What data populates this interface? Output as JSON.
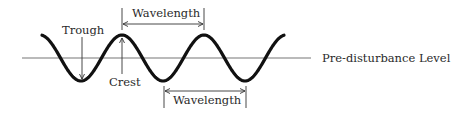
{
  "diagram": {
    "labels": {
      "trough": "Trough",
      "crest": "Crest",
      "wavelength_top": "Wavelength",
      "wavelength_bottom": "Wavelength",
      "baseline": "Pre-disturbance Level"
    },
    "wave": {
      "cycles": 3,
      "color": "#111111"
    },
    "baseline_color": "#777777",
    "annotation_color": "#333333"
  }
}
